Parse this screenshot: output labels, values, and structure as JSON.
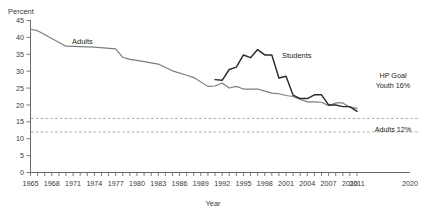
{
  "chart_data": {
    "type": "line",
    "title": "",
    "xlabel": "Year",
    "ylabel": "Percent",
    "xlim": [
      1965,
      2020
    ],
    "ylim": [
      0,
      45
    ],
    "grid": false,
    "legend_position": "inline-labels",
    "y_ticks": [
      0,
      5,
      10,
      15,
      20,
      25,
      30,
      35,
      40,
      45
    ],
    "x_tick_labels": [
      "1965",
      "1968",
      "1971",
      "1974",
      "1977",
      "1980",
      "1983",
      "1986",
      "1989",
      "1992",
      "1995",
      "1998",
      "2001",
      "2004",
      "2007",
      "2010",
      "2011",
      "2020"
    ],
    "x_tick_values": [
      1965,
      1968,
      1971,
      1974,
      1977,
      1980,
      1983,
      1986,
      1989,
      1992,
      1995,
      1998,
      2001,
      2004,
      2007,
      2010,
      2011,
      2020
    ],
    "series": [
      {
        "name": "Adults",
        "color": "#7c7c7c",
        "x": [
          1965,
          1966,
          1970,
          1974,
          1977,
          1978,
          1979,
          1980,
          1983,
          1985,
          1987,
          1988,
          1990,
          1991,
          1992,
          1993,
          1994,
          1995,
          1997,
          1998,
          1999,
          2000,
          2001,
          2002,
          2003,
          2004,
          2005,
          2006,
          2007,
          2008,
          2009,
          2010,
          2011
        ],
        "values": [
          42.4,
          42.0,
          37.4,
          37.1,
          36.6,
          34.1,
          33.5,
          33.2,
          32.1,
          30.1,
          28.8,
          28.1,
          25.5,
          25.6,
          26.5,
          25.0,
          25.5,
          24.7,
          24.7,
          24.1,
          23.5,
          23.3,
          22.8,
          22.5,
          21.6,
          20.9,
          20.9,
          20.8,
          19.8,
          20.6,
          20.6,
          19.3,
          19.0
        ]
      },
      {
        "name": "Students",
        "color": "#2b2b2b",
        "x": [
          1991,
          1992,
          1993,
          1994,
          1995,
          1996,
          1997,
          1998,
          1999,
          2000,
          2001,
          2002,
          2003,
          2004,
          2005,
          2006,
          2007,
          2008,
          2009,
          2010,
          2011
        ],
        "values": [
          27.5,
          27.3,
          30.5,
          31.2,
          34.8,
          34.0,
          36.4,
          34.8,
          34.8,
          28.0,
          28.5,
          22.9,
          21.9,
          21.9,
          23.0,
          23.0,
          20.0,
          20.0,
          19.5,
          19.5,
          18.1
        ]
      }
    ],
    "reference_lines": [
      {
        "name": "hp-goal-youth",
        "value": 16,
        "label": "HP Goal\nYouth 16%",
        "label_line1": "HP Goal",
        "label_line2": "Youth 16%",
        "style": "dashed",
        "color": "#9a9a9a"
      },
      {
        "name": "adults-target",
        "value": 12,
        "label": "Adults 12%",
        "style": "dashed",
        "color": "#9a9a9a"
      }
    ],
    "annotations": [
      {
        "name": "adults-series-label",
        "text": "Adults"
      },
      {
        "name": "students-series-label",
        "text": "Students"
      }
    ]
  }
}
